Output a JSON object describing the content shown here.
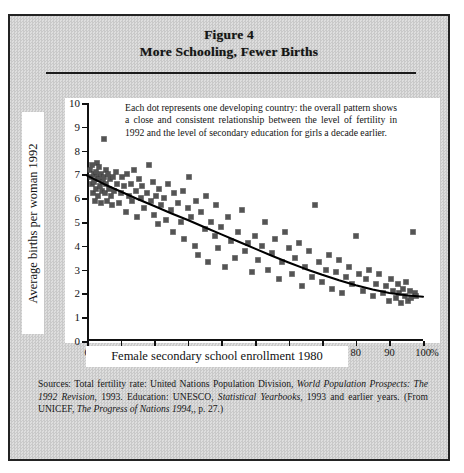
{
  "figure": {
    "title_line1": "Figure 4",
    "title_line2": "More Schooling, Fewer Births",
    "annotation": "Each dot represents one developing country: the overall pattern shows a close and consistent relationship between the level of fertility in 1992 and the level of secondary education for girls a decade earlier.",
    "percent_symbol": "%"
  },
  "caption": {
    "part1": "Sources: Total fertility rate: United Nations Population Division, ",
    "italic1": "World Population Prospects: The 1992 Revision",
    "part2": ", 1993. Education: UNESCO, ",
    "italic2": "Statistical Yearbooks",
    "part3": ", 1993 and earlier years. (From UNICEF, ",
    "italic3": "The Progress of Nations 1994",
    "part4": ",, p. 27.)"
  },
  "chart_data": {
    "type": "scatter",
    "title": "More Schooling, Fewer Births",
    "xlabel": "Female secondary school enrollment 1980",
    "ylabel": "Average births per woman 1992",
    "xlim": [
      0,
      100
    ],
    "ylim": [
      0,
      10
    ],
    "xticks": [
      0,
      10,
      20,
      30,
      40,
      50,
      60,
      70,
      80,
      90,
      100
    ],
    "yticks": [
      0,
      1,
      2,
      3,
      4,
      5,
      6,
      7,
      8,
      9,
      10
    ],
    "xtick_labels": [
      "0",
      "10",
      "20",
      "30",
      "40",
      "50",
      "60",
      "70",
      "80",
      "90",
      "100"
    ],
    "ytick_labels": [
      "0",
      "1",
      "2",
      "3",
      "4",
      "5",
      "6",
      "7",
      "8",
      "9",
      "10"
    ],
    "grid": false,
    "legend": null,
    "marker": "square",
    "marker_color": "#545454",
    "trend_color": "#000000",
    "annotations": [
      {
        "text": "Each dot represents one developing country: the overall pattern shows a close and consistent relationship between the level of fertility in 1992 and the level of secondary education for girls a decade earlier.",
        "x": 18,
        "y": 9.4
      }
    ],
    "points": [
      [
        1.0,
        7.2
      ],
      [
        1.3,
        6.9
      ],
      [
        1.5,
        6.6
      ],
      [
        1.6,
        7.4
      ],
      [
        1.8,
        6.2
      ],
      [
        2.0,
        7.0
      ],
      [
        2.2,
        6.7
      ],
      [
        2.4,
        5.9
      ],
      [
        2.6,
        7.1
      ],
      [
        2.8,
        6.4
      ],
      [
        3.0,
        6.9
      ],
      [
        3.1,
        7.5
      ],
      [
        3.3,
        6.1
      ],
      [
        3.5,
        6.8
      ],
      [
        3.7,
        7.3
      ],
      [
        3.9,
        6.5
      ],
      [
        4.1,
        5.8
      ],
      [
        4.3,
        7.0
      ],
      [
        4.5,
        6.3
      ],
      [
        4.7,
        6.7
      ],
      [
        5.0,
        8.5
      ],
      [
        5.2,
        6.9
      ],
      [
        5.4,
        6.2
      ],
      [
        5.6,
        7.2
      ],
      [
        5.8,
        6.6
      ],
      [
        6.0,
        5.9
      ],
      [
        6.3,
        7.0
      ],
      [
        6.6,
        6.4
      ],
      [
        6.9,
        6.8
      ],
      [
        7.2,
        6.1
      ],
      [
        7.5,
        5.7
      ],
      [
        7.8,
        6.9
      ],
      [
        8.1,
        6.3
      ],
      [
        8.5,
        7.1
      ],
      [
        9.0,
        6.6
      ],
      [
        9.5,
        5.8
      ],
      [
        10.0,
        6.2
      ],
      [
        10.5,
        6.9
      ],
      [
        11.0,
        6.5
      ],
      [
        11.5,
        5.4
      ],
      [
        12.0,
        7.0
      ],
      [
        12.5,
        6.1
      ],
      [
        13.0,
        6.6
      ],
      [
        13.5,
        5.9
      ],
      [
        14.0,
        7.2
      ],
      [
        14.5,
        6.3
      ],
      [
        15.0,
        5.2
      ],
      [
        15.5,
        6.8
      ],
      [
        16.0,
        6.0
      ],
      [
        16.5,
        6.5
      ],
      [
        17.0,
        5.6
      ],
      [
        18.0,
        6.2
      ],
      [
        18.5,
        7.4
      ],
      [
        19.0,
        5.9
      ],
      [
        19.5,
        6.7
      ],
      [
        20.0,
        5.3
      ],
      [
        20.5,
        6.1
      ],
      [
        21.0,
        4.9
      ],
      [
        21.5,
        6.4
      ],
      [
        22.0,
        5.7
      ],
      [
        23.0,
        6.0
      ],
      [
        23.5,
        5.1
      ],
      [
        24.0,
        6.6
      ],
      [
        25.0,
        5.5
      ],
      [
        25.5,
        4.6
      ],
      [
        26.0,
        6.2
      ],
      [
        27.0,
        5.8
      ],
      [
        28.0,
        5.0
      ],
      [
        28.5,
        6.3
      ],
      [
        29.0,
        4.3
      ],
      [
        30.0,
        5.6
      ],
      [
        30.5,
        6.9
      ],
      [
        31.0,
        5.2
      ],
      [
        32.0,
        4.0
      ],
      [
        32.5,
        5.9
      ],
      [
        33.0,
        3.6
      ],
      [
        34.0,
        5.4
      ],
      [
        35.0,
        4.7
      ],
      [
        35.5,
        6.1
      ],
      [
        36.0,
        3.3
      ],
      [
        37.0,
        5.0
      ],
      [
        38.0,
        4.4
      ],
      [
        38.5,
        5.7
      ],
      [
        39.0,
        3.9
      ],
      [
        40.0,
        4.8
      ],
      [
        41.0,
        3.1
      ],
      [
        42.0,
        5.2
      ],
      [
        43.0,
        4.2
      ],
      [
        44.0,
        3.5
      ],
      [
        45.0,
        4.6
      ],
      [
        46.0,
        5.5
      ],
      [
        47.0,
        3.8
      ],
      [
        48.0,
        4.1
      ],
      [
        49.0,
        2.9
      ],
      [
        50.0,
        4.4
      ],
      [
        51.0,
        3.4
      ],
      [
        52.0,
        4.0
      ],
      [
        53.0,
        5.0
      ],
      [
        54.0,
        3.0
      ],
      [
        55.0,
        3.7
      ],
      [
        56.0,
        4.3
      ],
      [
        57.0,
        2.6
      ],
      [
        58.0,
        3.3
      ],
      [
        59.0,
        4.6
      ],
      [
        60.0,
        3.9
      ],
      [
        61.0,
        2.8
      ],
      [
        62.0,
        3.5
      ],
      [
        63.0,
        4.1
      ],
      [
        64.0,
        2.3
      ],
      [
        65.0,
        3.1
      ],
      [
        66.0,
        3.8
      ],
      [
        67.0,
        2.7
      ],
      [
        68.0,
        5.7
      ],
      [
        69.0,
        3.3
      ],
      [
        70.0,
        2.5
      ],
      [
        71.0,
        3.0
      ],
      [
        72.0,
        3.6
      ],
      [
        73.0,
        2.2
      ],
      [
        74.0,
        2.9
      ],
      [
        75.0,
        3.4
      ],
      [
        76.0,
        2.0
      ],
      [
        77.0,
        2.7
      ],
      [
        78.0,
        3.1
      ],
      [
        79.0,
        2.4
      ],
      [
        80.0,
        4.4
      ],
      [
        81.0,
        2.8
      ],
      [
        82.0,
        2.1
      ],
      [
        83.0,
        2.6
      ],
      [
        84.0,
        3.0
      ],
      [
        85.0,
        1.9
      ],
      [
        86.0,
        2.4
      ],
      [
        87.0,
        2.8
      ],
      [
        88.0,
        2.0
      ],
      [
        89.0,
        2.3
      ],
      [
        90.0,
        1.7
      ],
      [
        90.5,
        2.6
      ],
      [
        91.0,
        2.1
      ],
      [
        92.0,
        1.8
      ],
      [
        92.5,
        2.4
      ],
      [
        93.0,
        2.0
      ],
      [
        93.5,
        1.6
      ],
      [
        94.0,
        2.2
      ],
      [
        94.5,
        1.9
      ],
      [
        95.0,
        2.5
      ],
      [
        95.5,
        1.7
      ],
      [
        96.0,
        2.1
      ],
      [
        96.5,
        1.8
      ],
      [
        97.0,
        4.6
      ],
      [
        97.5,
        2.0
      ],
      [
        98.0,
        1.9
      ]
    ],
    "trend_line": [
      [
        0,
        6.95
      ],
      [
        5,
        6.6
      ],
      [
        10,
        6.28
      ],
      [
        15,
        5.97
      ],
      [
        20,
        5.67
      ],
      [
        25,
        5.37
      ],
      [
        30,
        5.08
      ],
      [
        35,
        4.78
      ],
      [
        40,
        4.48
      ],
      [
        45,
        4.18
      ],
      [
        50,
        3.88
      ],
      [
        55,
        3.58
      ],
      [
        60,
        3.3
      ],
      [
        65,
        3.03
      ],
      [
        70,
        2.78
      ],
      [
        75,
        2.55
      ],
      [
        80,
        2.34
      ],
      [
        85,
        2.16
      ],
      [
        90,
        2.02
      ],
      [
        95,
        1.92
      ],
      [
        100,
        1.86
      ]
    ]
  }
}
